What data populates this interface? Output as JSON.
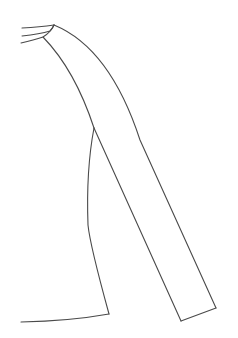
{
  "figure": {
    "stroke_color": "#4a4a4a",
    "background": "#ffffff",
    "stroke_width": 1.1
  }
}
